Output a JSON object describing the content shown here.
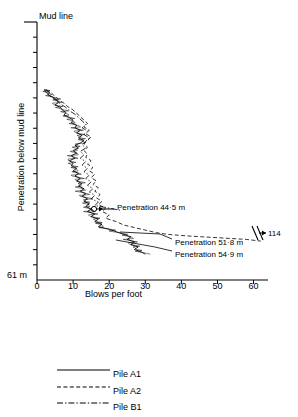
{
  "chart_data": {
    "type": "line",
    "title": "",
    "subtitle": "",
    "xlabel": "Blows per foot",
    "ylabel": "Penetration below mud line",
    "xlim": [
      0,
      64
    ],
    "ylim": [
      0,
      61
    ],
    "y_inverted": true,
    "y_units": "m",
    "grid": false,
    "legend_position": "bottom",
    "xticks": [
      0,
      10,
      20,
      30,
      40,
      50,
      60
    ],
    "xtick_labels": [
      "0",
      "10",
      "20",
      "30",
      "40",
      "50",
      "60"
    ],
    "ytick_count": 16,
    "ytick_labels_shown": [
      "Mud line",
      "61 m"
    ],
    "axis_break": {
      "present": true,
      "x_position": 62,
      "symbol": "//",
      "note": "value beyond axis range shown with arrow"
    },
    "series": [
      {
        "name": "Pile A1",
        "style": "solid",
        "final_penetration_m": 54.9,
        "points": [
          [
            2.0,
            16.0
          ],
          [
            3.5,
            16.6
          ],
          [
            3.0,
            17.2
          ],
          [
            4.5,
            17.8
          ],
          [
            5.5,
            18.4
          ],
          [
            6.0,
            19.0
          ],
          [
            5.0,
            19.6
          ],
          [
            6.5,
            20.2
          ],
          [
            7.0,
            20.8
          ],
          [
            8.0,
            21.4
          ],
          [
            7.5,
            22.0
          ],
          [
            9.0,
            22.6
          ],
          [
            10.0,
            23.2
          ],
          [
            9.5,
            23.8
          ],
          [
            11.0,
            24.4
          ],
          [
            10.5,
            25.0
          ],
          [
            12.0,
            25.6
          ],
          [
            11.0,
            26.2
          ],
          [
            12.5,
            26.8
          ],
          [
            11.5,
            27.4
          ],
          [
            13.0,
            28.0
          ],
          [
            12.0,
            28.6
          ],
          [
            10.5,
            29.2
          ],
          [
            11.5,
            29.8
          ],
          [
            10.0,
            30.4
          ],
          [
            11.0,
            31.0
          ],
          [
            9.5,
            31.6
          ],
          [
            10.5,
            32.2
          ],
          [
            9.0,
            32.8
          ],
          [
            10.0,
            33.4
          ],
          [
            9.5,
            34.0
          ],
          [
            11.0,
            34.6
          ],
          [
            10.0,
            35.2
          ],
          [
            11.5,
            35.8
          ],
          [
            10.5,
            36.4
          ],
          [
            12.0,
            37.0
          ],
          [
            11.0,
            37.6
          ],
          [
            12.5,
            38.2
          ],
          [
            11.5,
            38.8
          ],
          [
            13.0,
            39.4
          ],
          [
            12.0,
            40.0
          ],
          [
            13.5,
            40.6
          ],
          [
            12.5,
            41.2
          ],
          [
            14.0,
            41.8
          ],
          [
            13.0,
            42.4
          ],
          [
            14.5,
            43.0
          ],
          [
            13.5,
            43.6
          ],
          [
            15.0,
            44.2
          ],
          [
            14.0,
            44.8
          ],
          [
            16.0,
            45.4
          ],
          [
            15.0,
            46.0
          ],
          [
            17.0,
            46.6
          ],
          [
            16.0,
            47.2
          ],
          [
            18.0,
            47.8
          ],
          [
            17.0,
            48.4
          ],
          [
            20.0,
            49.0
          ],
          [
            22.0,
            49.6
          ],
          [
            24.0,
            50.2
          ],
          [
            26.0,
            50.8
          ],
          [
            25.0,
            51.4
          ],
          [
            27.0,
            52.0
          ],
          [
            26.0,
            52.6
          ],
          [
            28.0,
            53.2
          ],
          [
            27.0,
            53.8
          ],
          [
            29.0,
            54.4
          ],
          [
            30.0,
            54.9
          ]
        ]
      },
      {
        "name": "Pile A2",
        "style": "dashed",
        "final_penetration_m": 51.8,
        "points": [
          [
            2.5,
            16.0
          ],
          [
            4.0,
            16.8
          ],
          [
            5.0,
            17.6
          ],
          [
            6.0,
            18.4
          ],
          [
            7.5,
            19.2
          ],
          [
            8.5,
            20.0
          ],
          [
            10.0,
            20.8
          ],
          [
            11.0,
            21.6
          ],
          [
            12.0,
            22.4
          ],
          [
            13.0,
            23.2
          ],
          [
            14.0,
            24.0
          ],
          [
            13.0,
            24.8
          ],
          [
            14.5,
            25.6
          ],
          [
            13.5,
            26.4
          ],
          [
            15.0,
            27.2
          ],
          [
            14.0,
            28.0
          ],
          [
            13.0,
            28.8
          ],
          [
            14.0,
            29.6
          ],
          [
            13.0,
            30.4
          ],
          [
            14.0,
            31.2
          ],
          [
            13.5,
            32.0
          ],
          [
            15.0,
            32.8
          ],
          [
            14.0,
            33.6
          ],
          [
            15.5,
            34.4
          ],
          [
            14.5,
            35.2
          ],
          [
            16.0,
            36.0
          ],
          [
            15.0,
            36.8
          ],
          [
            16.5,
            37.6
          ],
          [
            15.5,
            38.4
          ],
          [
            17.0,
            39.2
          ],
          [
            16.0,
            40.0
          ],
          [
            17.5,
            40.8
          ],
          [
            16.5,
            41.6
          ],
          [
            18.0,
            42.4
          ],
          [
            17.0,
            43.2
          ],
          [
            19.0,
            44.0
          ],
          [
            18.0,
            44.8
          ],
          [
            20.0,
            45.6
          ],
          [
            19.0,
            46.4
          ],
          [
            22.0,
            47.2
          ],
          [
            24.0,
            48.0
          ],
          [
            27.0,
            48.6
          ],
          [
            30.0,
            49.2
          ],
          [
            33.0,
            49.8
          ],
          [
            36.0,
            50.2
          ],
          [
            42.0,
            50.6
          ],
          [
            50.0,
            51.0
          ],
          [
            58.0,
            51.4
          ],
          [
            62.0,
            51.8
          ]
        ]
      },
      {
        "name": "Pile B1",
        "style": "dash-dot",
        "final_penetration_m": 44.5,
        "points": [
          [
            2.0,
            16.2
          ],
          [
            3.0,
            17.0
          ],
          [
            4.0,
            17.8
          ],
          [
            5.5,
            18.6
          ],
          [
            6.5,
            19.4
          ],
          [
            8.0,
            20.2
          ],
          [
            9.0,
            21.0
          ],
          [
            10.5,
            21.8
          ],
          [
            11.5,
            22.6
          ],
          [
            12.5,
            23.4
          ],
          [
            13.5,
            24.2
          ],
          [
            12.5,
            25.0
          ],
          [
            14.0,
            25.8
          ],
          [
            13.0,
            26.6
          ],
          [
            14.5,
            27.4
          ],
          [
            13.5,
            28.2
          ],
          [
            12.5,
            29.0
          ],
          [
            13.5,
            29.8
          ],
          [
            12.0,
            30.6
          ],
          [
            13.0,
            31.4
          ],
          [
            12.0,
            32.2
          ],
          [
            13.5,
            33.0
          ],
          [
            12.5,
            33.8
          ],
          [
            14.0,
            34.6
          ],
          [
            13.0,
            35.4
          ],
          [
            14.5,
            36.2
          ],
          [
            13.5,
            37.0
          ],
          [
            15.0,
            37.8
          ],
          [
            14.0,
            38.6
          ],
          [
            15.5,
            39.4
          ],
          [
            14.5,
            40.2
          ],
          [
            16.0,
            41.0
          ],
          [
            15.0,
            41.8
          ],
          [
            17.0,
            42.6
          ],
          [
            16.0,
            43.4
          ],
          [
            20.0,
            44.0
          ],
          [
            23.0,
            44.5
          ]
        ]
      }
    ],
    "annotations": [
      {
        "id": "pen-445",
        "text": "Penetration 44·5 m",
        "value_m": 44.5,
        "marker": "circle-arrow",
        "marker_x": 23,
        "marker_y": 44.5
      },
      {
        "id": "pen-518",
        "text": "Penetration 51·8 m",
        "value_m": 51.8
      },
      {
        "id": "pen-549",
        "text": "Penetration 54·9 m",
        "value_m": 54.9
      },
      {
        "id": "offscale-114",
        "text": "114",
        "value": 114,
        "note": "blows per foot beyond axis break"
      },
      {
        "id": "mud-line",
        "text": "Mud line",
        "value_m": 0
      },
      {
        "id": "depth-end",
        "text": "61 m",
        "value_m": 61
      }
    ]
  },
  "axes": {
    "mud_line_label": "Mud line",
    "y_axis_label": "Penetration below mud line",
    "x_axis_label": "Blows per foot",
    "depth_end_label": "61 m",
    "xtick_labels": [
      "0",
      "10",
      "20",
      "30",
      "40",
      "50",
      "60"
    ]
  },
  "annotations": {
    "pen_445": "Penetration 44·5 m",
    "pen_518": "Penetration 51·8 m",
    "pen_549": "Penetration 54·9 m",
    "offscale": "114"
  },
  "legend": {
    "items": [
      {
        "label": "Pile A1",
        "style": "solid"
      },
      {
        "label": "Pile A2",
        "style": "dashed"
      },
      {
        "label": "Pile B1",
        "style": "dash-dot"
      }
    ]
  },
  "colors": {
    "ink": "#000000",
    "background": "#ffffff"
  }
}
